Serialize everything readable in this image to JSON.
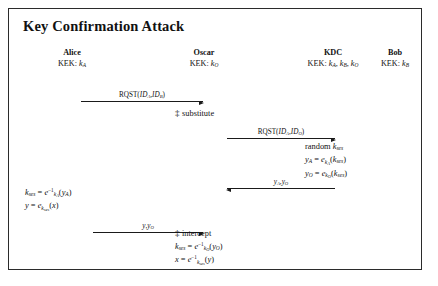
{
  "figure": {
    "title": "Key Confirmation Attack",
    "border_color": "#2b2b2b",
    "background": "#ffffff",
    "ink_color": "#111111"
  },
  "parties": [
    {
      "name": "Alice",
      "kek_prefix": "KEK: ",
      "kek_keys": "kA"
    },
    {
      "name": "Oscar",
      "kek_prefix": "KEK: ",
      "kek_keys": "kO"
    },
    {
      "name": "KDC",
      "kek_prefix": "KEK: ",
      "kek_keys": "kA, kB, kO"
    },
    {
      "name": "Bob",
      "kek_prefix": "KEK: ",
      "kek_keys": "kB"
    }
  ],
  "messages": [
    {
      "id": "alice-to-oscar-rqst",
      "label": "RQST(IDA,IDB)",
      "direction": "right",
      "from": "Alice",
      "to": "Oscar"
    },
    {
      "id": "oscar-to-kdc-rqst",
      "label": "RQST(IDA,IDO)",
      "direction": "right",
      "from": "Oscar",
      "to": "KDC"
    },
    {
      "id": "kdc-to-oscar-keys",
      "label": "yA,yO",
      "direction": "left",
      "from": "KDC",
      "to": "Oscar"
    },
    {
      "id": "alice-to-oscar-cipher",
      "label": "y,yO",
      "direction": "right",
      "from": "Alice",
      "to": "Oscar"
    }
  ],
  "annotations": {
    "substitute": {
      "marker": "‡",
      "text": "substitute"
    },
    "intercept": {
      "marker": "‡",
      "text": "intercept"
    }
  },
  "blocks": {
    "kdc": {
      "line1_word": "random",
      "line1_key": "kses",
      "line2": "yA = ekA(kses)",
      "line3": "yO = ekO(kses)"
    },
    "alice": {
      "line1": "kses = e^-1 kA (yA)",
      "line2": "y = ekses(x)"
    },
    "oscar": {
      "line1": "kses = e^-1 kO (yO)",
      "line2": "x = e^-1 kses (y)"
    }
  },
  "symbols": {
    "e": "e",
    "k": "k",
    "y": "y",
    "x": "x",
    "sub_ses": "ses",
    "sub_A": "A",
    "sub_B": "B",
    "sub_O": "O",
    "inverse": "−1",
    "equals": "=",
    "comma": ",",
    "rqst": "RQST",
    "id": "ID",
    "paren_open": "(",
    "paren_close": ")",
    "kek_label": "KEK:"
  }
}
